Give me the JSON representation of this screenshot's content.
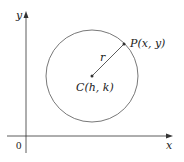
{
  "diagram": {
    "axes": {
      "x_label": "x",
      "y_label": "y",
      "origin_label": "0"
    },
    "circle": {
      "center_label": "C(h, k)",
      "point_label": "P(x, y)",
      "radius_label": "r"
    },
    "colors": {
      "line": "#333333",
      "background": "#ffffff"
    }
  }
}
